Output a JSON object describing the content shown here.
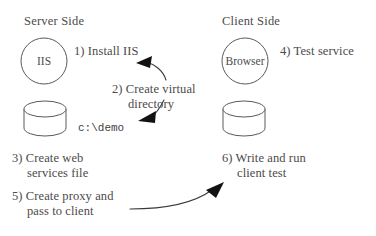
{
  "diagram": {
    "title_left": "Server Side",
    "title_right": "Client Side",
    "nodes": [
      {
        "id": "iis",
        "label": "IIS",
        "shape": "circle",
        "side": "server"
      },
      {
        "id": "server-db",
        "label": "",
        "shape": "cylinder",
        "side": "server"
      },
      {
        "id": "browser",
        "label": "Browser",
        "shape": "circle",
        "side": "client"
      },
      {
        "id": "client-db",
        "label": "",
        "shape": "cylinder",
        "side": "client"
      }
    ],
    "steps": [
      {
        "number": "1)",
        "text": "1) Install IIS",
        "side": "server"
      },
      {
        "number": "2)",
        "text": "2) Create virtual",
        "text2": "directory",
        "side": "server"
      },
      {
        "number": "3)",
        "text": "3) Create web",
        "text2": "services file",
        "side": "server"
      },
      {
        "number": "4)",
        "text": "4) Test service",
        "side": "client"
      },
      {
        "number": "5)",
        "text": "5) Create proxy and",
        "text2": "pass to client",
        "side": "server"
      },
      {
        "number": "6)",
        "text": "6) Write and run",
        "text2": "client test",
        "side": "client"
      }
    ],
    "path_label": "c:\\demo",
    "arrows": [
      {
        "id": "arrow-install-iis",
        "from": "step-1",
        "to": "iis"
      },
      {
        "id": "arrow-virtual-directory",
        "from": "step-2",
        "to": "server-db"
      },
      {
        "id": "arrow-proxy-to-client",
        "from": "step-5",
        "to": "client-db"
      }
    ],
    "colors": {
      "stroke": "#5a5a5a",
      "arrow": "#121212",
      "text": "#4c4a4a",
      "background": "#ffffff"
    }
  }
}
